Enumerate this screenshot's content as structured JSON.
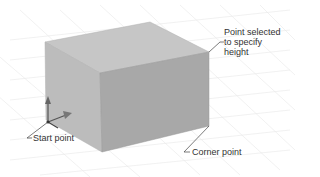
{
  "figure": {
    "colors": {
      "background": "#ffffff",
      "grid": "#e6e6e6",
      "top_face": "#c4c4c4",
      "left_face": "#b9b9b9",
      "front_face": "#a6a6a6",
      "leader": "#444444",
      "text": "#333333"
    }
  },
  "annotations": {
    "height_point": {
      "lines": [
        "Point selected",
        "to specify",
        "height"
      ]
    },
    "start_point": {
      "label": "Start point"
    },
    "corner_point": {
      "label": "Corner point"
    }
  },
  "icons": {
    "ucs_icon": "ucs-axis-icon"
  }
}
